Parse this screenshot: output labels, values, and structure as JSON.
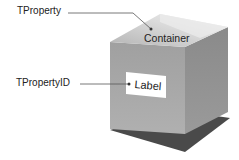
{
  "diagram": {
    "callouts": [
      {
        "id": "tproperty",
        "text": "TProperty"
      },
      {
        "id": "tpropertyid",
        "text": "TPropertyID"
      }
    ],
    "container_label": "Container",
    "inner_label": "Label",
    "colors": {
      "front_face": "#a8a8a8",
      "right_face": "#8e8e8e",
      "top_face": "#c6c6c6",
      "top_inner": "#e4e4e4",
      "shadow": "#4a4a4a",
      "label_box": "#ffffff",
      "line": "#555555"
    }
  }
}
